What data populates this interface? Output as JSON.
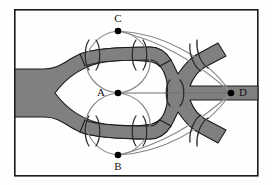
{
  "figure": {
    "title": "",
    "type": "topological-diagram",
    "frame": {
      "x": 14,
      "y": 9,
      "width": 244,
      "height": 167,
      "stroke": "#1a1a1a",
      "stroke_width": 1.6,
      "fill": "#fefefe"
    },
    "band": {
      "name": "thickened-graph-band",
      "fill": "#808080",
      "stroke": "#1c1c1c",
      "stroke_width": 1.2,
      "description": "Grey ribbon entering at left, splitting into upper and lower branches, rejoining at a central vertical trunk, then splitting again into two diagonal branches at the right"
    },
    "nodes": [
      {
        "id": "C",
        "label": "C",
        "x": 118,
        "y": 31,
        "label_x": 118,
        "label_y": 20,
        "r": 3.2,
        "fill": "#000000"
      },
      {
        "id": "A",
        "label": "A",
        "x": 118,
        "y": 93,
        "label_x": 101,
        "label_y": 95,
        "r": 3.2,
        "fill": "#000000"
      },
      {
        "id": "B",
        "label": "B",
        "x": 118,
        "y": 155,
        "label_x": 118,
        "label_y": 169,
        "r": 3.2,
        "fill": "#000000"
      },
      {
        "id": "D",
        "label": "D",
        "x": 231,
        "y": 93,
        "label_x": 243,
        "label_y": 95,
        "r": 3.2,
        "fill": "#000000"
      }
    ],
    "curves": [
      {
        "name": "loop-A-C-left",
        "from": "A",
        "to": "C",
        "side": "left",
        "stroke": "#8a8a8a"
      },
      {
        "name": "loop-A-C-right",
        "from": "A",
        "to": "C",
        "side": "right",
        "stroke": "#8a8a8a"
      },
      {
        "name": "loop-A-B-left",
        "from": "A",
        "to": "B",
        "side": "left",
        "stroke": "#8a8a8a"
      },
      {
        "name": "loop-A-B-right",
        "from": "A",
        "to": "B",
        "side": "right",
        "stroke": "#8a8a8a"
      },
      {
        "name": "arc-C-D-outer",
        "from": "C",
        "to": "D",
        "side": "upper",
        "stroke": "#8a8a8a"
      },
      {
        "name": "arc-C-D-inner",
        "from": "C",
        "to": "D",
        "side": "lower",
        "stroke": "#8a8a8a"
      },
      {
        "name": "arc-B-D-outer",
        "from": "B",
        "to": "D",
        "side": "lower",
        "stroke": "#8a8a8a"
      },
      {
        "name": "arc-B-D-inner",
        "from": "B",
        "to": "D",
        "side": "upper",
        "stroke": "#8a8a8a"
      },
      {
        "name": "edge-A-D-straight",
        "from": "A",
        "to": "D",
        "side": "straight",
        "stroke": "#6e6e6e"
      }
    ],
    "brackets": [
      {
        "name": "bracket-pair-upper-left",
        "x": 92,
        "y": 55,
        "orientation": ")("
      },
      {
        "name": "bracket-pair-upper-right",
        "x": 139,
        "y": 55,
        "orientation": ")("
      },
      {
        "name": "bracket-pair-lower-left",
        "x": 92,
        "y": 131,
        "orientation": ")("
      },
      {
        "name": "bracket-pair-lower-right",
        "x": 139,
        "y": 131,
        "orientation": ")("
      },
      {
        "name": "bracket-pair-center-right",
        "x": 175,
        "y": 93,
        "orientation": ")("
      },
      {
        "name": "bracket-pair-upper-diagonal",
        "x": 196,
        "y": 57,
        "orientation": ")("
      },
      {
        "name": "bracket-pair-lower-diagonal",
        "x": 196,
        "y": 129,
        "orientation": ")("
      }
    ]
  }
}
